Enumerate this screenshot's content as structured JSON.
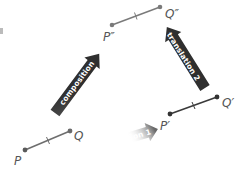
{
  "diagram": {
    "colors": {
      "segment_original": "#6e6e6e",
      "segment_image1": "#3a3a3a",
      "segment_image2": "#7a7a7a",
      "point_fill": "#5a5a5a",
      "arrow_dark": "#2f2f2f",
      "arrow_fade": "#ffffff",
      "label": "#555555"
    },
    "segments": [
      {
        "name": "PQ",
        "p_label": "P",
        "q_label": "Q",
        "p": [
          25,
          150
        ],
        "q": [
          70,
          131
        ]
      },
      {
        "name": "P'Q'",
        "p_label": "P′",
        "q_label": "Q′",
        "p": [
          170,
          114
        ],
        "q": [
          217,
          97
        ]
      },
      {
        "name": "P''Q''",
        "p_label": "P″",
        "q_label": "Q″",
        "p": [
          112,
          25
        ],
        "q": [
          160,
          7
        ]
      }
    ],
    "arrows": [
      {
        "name": "translation-1",
        "label": "translation 1",
        "from": [
          88,
          150
        ],
        "to": [
          158,
          129
        ]
      },
      {
        "name": "translation-2",
        "label": "translation 2",
        "from": [
          205,
          88
        ],
        "to": [
          167,
          27
        ]
      },
      {
        "name": "composition",
        "label": "composition",
        "from": [
          55,
          113
        ],
        "to": [
          99,
          54
        ]
      }
    ]
  }
}
